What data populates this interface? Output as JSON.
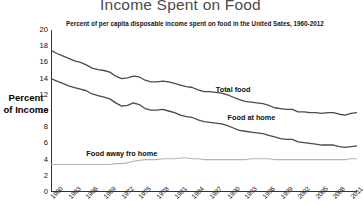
{
  "chart_data": {
    "type": "line",
    "title": "Income Spent on Food",
    "subtitle": "Percent of per capita disposable income spent on food in the United Sates, 1960-2012",
    "xlabel": "",
    "ylabel": "Percent of Income",
    "ylabel_line1": "Percent",
    "ylabel_line2": "of Income",
    "ylim": [
      0,
      20
    ],
    "xlim": [
      1960,
      2012
    ],
    "grid": false,
    "legend_position": "inline-labels",
    "y_ticks": [
      20,
      18,
      16,
      14,
      12,
      10,
      8,
      6,
      4,
      2,
      0
    ],
    "x_ticks": [
      1960,
      1963,
      1966,
      1969,
      1972,
      1975,
      1978,
      1981,
      1984,
      1987,
      1990,
      1993,
      1996,
      1999,
      2002,
      2005,
      2008,
      2011
    ],
    "x": [
      1960,
      1961,
      1962,
      1963,
      1964,
      1965,
      1966,
      1967,
      1968,
      1969,
      1970,
      1971,
      1972,
      1973,
      1974,
      1975,
      1976,
      1977,
      1978,
      1979,
      1980,
      1981,
      1982,
      1983,
      1984,
      1985,
      1986,
      1987,
      1988,
      1989,
      1990,
      1991,
      1992,
      1993,
      1994,
      1995,
      1996,
      1997,
      1998,
      1999,
      2000,
      2001,
      2002,
      2003,
      2004,
      2005,
      2006,
      2007,
      2008,
      2009,
      2010,
      2011,
      2012
    ],
    "series": [
      {
        "name": "Total food",
        "color": "#4a4a4a",
        "label_x": 1988,
        "label_y": 12.6,
        "values": [
          17.5,
          17.1,
          16.8,
          16.5,
          16.2,
          16.0,
          15.7,
          15.3,
          15.1,
          15.0,
          14.8,
          14.3,
          14.0,
          14.1,
          14.3,
          14.2,
          13.8,
          13.6,
          13.6,
          13.7,
          13.6,
          13.4,
          13.2,
          13.0,
          12.9,
          12.6,
          12.4,
          12.4,
          12.3,
          12.2,
          12.0,
          11.7,
          11.4,
          11.2,
          11.1,
          11.0,
          10.9,
          10.7,
          10.4,
          10.3,
          10.2,
          10.2,
          9.9,
          9.9,
          9.8,
          9.8,
          9.7,
          9.8,
          9.8,
          9.6,
          9.5,
          9.7,
          9.8
        ]
      },
      {
        "name": "Food at home",
        "color": "#4a4a4a",
        "label_x": 1990,
        "label_y": 9.1,
        "values": [
          14.0,
          13.7,
          13.4,
          13.1,
          12.9,
          12.7,
          12.5,
          12.1,
          11.9,
          11.7,
          11.5,
          11.0,
          10.6,
          10.7,
          11.0,
          10.8,
          10.3,
          10.1,
          10.1,
          10.2,
          10.0,
          9.8,
          9.5,
          9.3,
          9.2,
          8.9,
          8.7,
          8.6,
          8.5,
          8.4,
          8.2,
          7.9,
          7.6,
          7.5,
          7.4,
          7.3,
          7.2,
          7.0,
          6.8,
          6.6,
          6.5,
          6.5,
          6.2,
          6.1,
          6.0,
          5.9,
          5.8,
          5.8,
          5.8,
          5.6,
          5.5,
          5.6,
          5.7
        ]
      },
      {
        "name": "Food away fro home",
        "color": "#b5b5b5",
        "label_x": 1966,
        "label_y": 4.7,
        "values": [
          3.4,
          3.4,
          3.4,
          3.4,
          3.4,
          3.4,
          3.4,
          3.4,
          3.4,
          3.4,
          3.4,
          3.5,
          3.5,
          3.6,
          3.8,
          3.9,
          4.0,
          4.0,
          4.0,
          4.1,
          4.1,
          4.1,
          4.2,
          4.2,
          4.1,
          4.1,
          4.0,
          4.0,
          4.0,
          4.0,
          4.0,
          4.0,
          4.0,
          4.0,
          4.1,
          4.1,
          4.1,
          4.1,
          4.0,
          4.0,
          4.0,
          4.0,
          4.0,
          4.0,
          4.0,
          4.0,
          4.0,
          4.0,
          4.0,
          4.0,
          4.0,
          4.1,
          4.1
        ]
      }
    ]
  }
}
